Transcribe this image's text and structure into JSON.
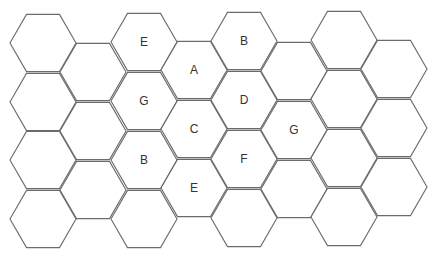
{
  "diagram": {
    "type": "hexagon-grid",
    "orientation": "flat-top",
    "hex_radius": 33,
    "stroke_color": "#6b6b6b",
    "fill_color": "#ffffff",
    "label_color": "#333333",
    "columns": [
      {
        "cx": 43,
        "cells": [
          {
            "cy": 43,
            "label": ""
          },
          {
            "cy": 102,
            "label": ""
          },
          {
            "cy": 160,
            "label": ""
          },
          {
            "cy": 219,
            "label": ""
          }
        ]
      },
      {
        "cx": 93,
        "cells": [
          {
            "cy": 72,
            "label": ""
          },
          {
            "cy": 131,
            "label": ""
          },
          {
            "cy": 190,
            "label": ""
          }
        ]
      },
      {
        "cx": 144,
        "cells": [
          {
            "cy": 42,
            "label": "E"
          },
          {
            "cy": 101,
            "label": "G"
          },
          {
            "cy": 160,
            "label": "B"
          },
          {
            "cy": 219,
            "label": ""
          }
        ]
      },
      {
        "cx": 194,
        "cells": [
          {
            "cy": 70,
            "label": "A"
          },
          {
            "cy": 129,
            "label": "C"
          },
          {
            "cy": 188,
            "label": "E"
          }
        ]
      },
      {
        "cx": 244,
        "cells": [
          {
            "cy": 41,
            "label": "B"
          },
          {
            "cy": 100,
            "label": "D"
          },
          {
            "cy": 159,
            "label": "F"
          },
          {
            "cy": 218,
            "label": ""
          }
        ]
      },
      {
        "cx": 294,
        "cells": [
          {
            "cy": 71,
            "label": ""
          },
          {
            "cy": 130,
            "label": "G"
          },
          {
            "cy": 189,
            "label": ""
          }
        ]
      },
      {
        "cx": 344,
        "cells": [
          {
            "cy": 40,
            "label": ""
          },
          {
            "cy": 99,
            "label": ""
          },
          {
            "cy": 158,
            "label": ""
          },
          {
            "cy": 217,
            "label": ""
          }
        ]
      },
      {
        "cx": 394,
        "cells": [
          {
            "cy": 69,
            "label": ""
          },
          {
            "cy": 128,
            "label": ""
          },
          {
            "cy": 187,
            "label": ""
          }
        ]
      }
    ],
    "labels": [
      "E",
      "B",
      "A",
      "G",
      "D",
      "C",
      "G",
      "B",
      "F",
      "E"
    ]
  }
}
